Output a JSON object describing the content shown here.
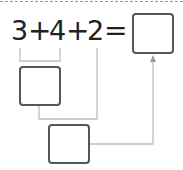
{
  "equation": {
    "tokens": [
      "3",
      "+",
      "4",
      "+",
      "2",
      "="
    ]
  },
  "boxes": {
    "answer": {
      "value": ""
    },
    "partial_sum": {
      "value": ""
    },
    "second_step": {
      "value": ""
    }
  },
  "colors": {
    "text": "#222222",
    "box_border": "#555555",
    "connector": "#bdbdbd",
    "dashed_rule": "#9a9a9a"
  }
}
